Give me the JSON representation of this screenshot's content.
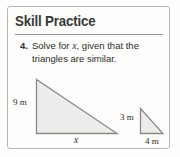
{
  "card": {
    "heading": "Skill Practice",
    "border_color": "#b9b9b7",
    "background_color": "#fdfdfb"
  },
  "problem": {
    "number": "4.",
    "text_before_var": "Solve for ",
    "variable": "x",
    "text_after_var": ", given that the triangles are similar.",
    "full_text": "4. Solve for x, given that the triangles are similar."
  },
  "figure": {
    "caption": "Two similar right triangles",
    "stroke_color": "#8a8a88",
    "fill_color": "#ececea",
    "large_triangle": {
      "name": "large-triangle",
      "vertical_leg_label": "9 m",
      "horizontal_leg_label": "x",
      "right_angle_position": "bottom-left"
    },
    "small_triangle": {
      "name": "small-triangle",
      "vertical_leg_label": "3 m",
      "horizontal_leg_label": "4 m",
      "right_angle_position": "bottom-left"
    }
  },
  "labels": {
    "nine_m": "9 m",
    "three_m": "3 m",
    "four_m": "4 m",
    "x": "x"
  }
}
